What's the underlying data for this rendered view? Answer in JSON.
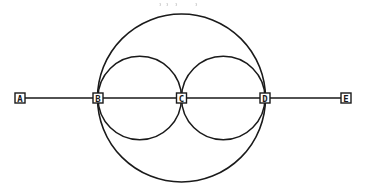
{
  "diagram": {
    "type": "geometric-construction",
    "stroke_color": "#1a1a1a",
    "background": "#ffffff",
    "line": {
      "y": 98,
      "x_start": 20,
      "x_end": 346
    },
    "circles": [
      {
        "id": "outer",
        "cx": 181.5,
        "cy": 98,
        "r": 84,
        "stroke_width": 1.6
      },
      {
        "id": "left-inner",
        "cx": 139.75,
        "cy": 98,
        "r": 41.75,
        "stroke_width": 1.5
      },
      {
        "id": "right-inner",
        "cx": 223.25,
        "cy": 98,
        "r": 41.75,
        "stroke_width": 1.5
      }
    ],
    "points": [
      {
        "id": "A",
        "label": "A",
        "x": 20,
        "y": 98
      },
      {
        "id": "B",
        "label": "B",
        "x": 98,
        "y": 98
      },
      {
        "id": "C",
        "label": "C",
        "x": 181.5,
        "y": 98
      },
      {
        "id": "D",
        "label": "D",
        "x": 265,
        "y": 98
      },
      {
        "id": "E",
        "label": "E",
        "x": 346,
        "y": 98
      }
    ]
  }
}
